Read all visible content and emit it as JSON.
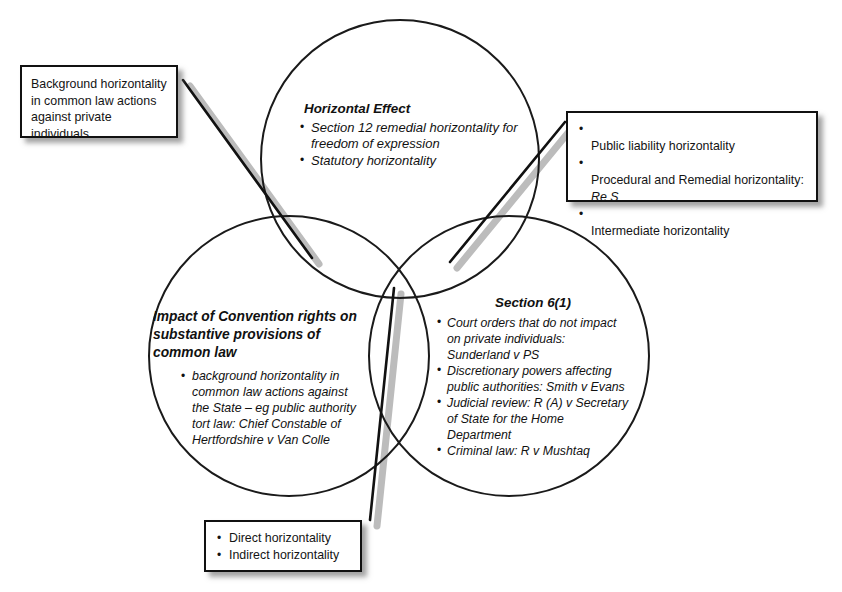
{
  "diagram": {
    "colors": {
      "circle_stroke": "#1a1a1a",
      "box_border": "#111111",
      "connector_dark": "#111111",
      "connector_shadow": "#b3b3b3",
      "text": "#141414",
      "background": "#ffffff"
    }
  },
  "circles": {
    "top": {
      "name": "horizontal-effect",
      "heading": "Horizontal Effect",
      "bullets": [
        "Section 12 remedial horizontality for\nfreedom of expression",
        "Statutory horizontality"
      ]
    },
    "left": {
      "name": "impact-of-convention-rights",
      "heading": "Impact of Convention rights\non substantive provisions of\ncommon law",
      "bullets": [
        "background horizontality in\ncommon law actions against\nthe State – eg public authority\ntort law: Chief Constable of\nHertfordshire v Van Colle"
      ]
    },
    "right": {
      "name": "section-6-1",
      "heading": "Section 6(1)",
      "bullets": [
        "Court orders that do not impact\non private individuals:\nSunderland v PS",
        "Discretionary powers affecting\npublic authorities: Smith v Evans",
        "Judicial review: R (A) v Secretary\nof State for the Home\nDepartment",
        "Criminal law: R v Mushtaq"
      ]
    }
  },
  "callouts": {
    "background_horizontality": {
      "name": "callout-background-horizontality",
      "text": "Background horizontality\nin common law actions\nagainst private\nindividuals"
    },
    "public_liability": {
      "name": "callout-public-liability",
      "bullets": [
        {
          "text": "Public liability horizontality",
          "italic_tail": ""
        },
        {
          "text": "Procedural and Remedial horizontality:\n",
          "italic_tail": "Re S"
        },
        {
          "text": "Intermediate horizontality",
          "italic_tail": ""
        }
      ]
    },
    "direct_indirect": {
      "name": "callout-direct-indirect",
      "bullets": [
        "Direct horizontality",
        "Indirect horizontality"
      ]
    }
  }
}
